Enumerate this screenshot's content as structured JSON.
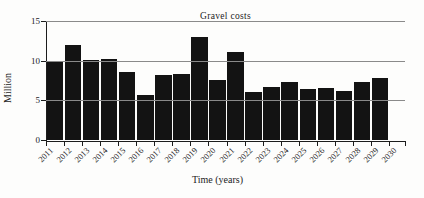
{
  "chart_data": {
    "type": "bar",
    "title": "Gravel costs",
    "xlabel": "Time (years)",
    "ylabel": "Million",
    "categories": [
      "2011",
      "2012",
      "2013",
      "2014",
      "2015",
      "2016",
      "2017",
      "2018",
      "2019",
      "2020",
      "2021",
      "2022",
      "2023",
      "2024",
      "2025",
      "2026",
      "2027",
      "2028",
      "2029"
    ],
    "values": [
      10.0,
      12.1,
      10.1,
      10.3,
      8.6,
      5.7,
      8.3,
      8.4,
      13.0,
      7.6,
      11.1,
      6.1,
      6.8,
      7.4,
      6.5,
      6.6,
      6.2,
      7.4,
      7.9
    ],
    "x_tick_labels": [
      "2011",
      "2012",
      "2013",
      "2014",
      "2015",
      "2016",
      "2017",
      "2018",
      "2019",
      "2020",
      "2021",
      "2022",
      "2023",
      "2024",
      "2025",
      "2026",
      "2027",
      "2028",
      "2029",
      "2030"
    ],
    "yticks": [
      0,
      5,
      10,
      15
    ],
    "ylim": [
      0,
      15
    ],
    "grid": true,
    "legend": "none",
    "bar_color": "#131313",
    "gridline_color": "#8a8a8a",
    "axis_color": "#1c1c1c",
    "background_color": "#fdfdfc"
  }
}
